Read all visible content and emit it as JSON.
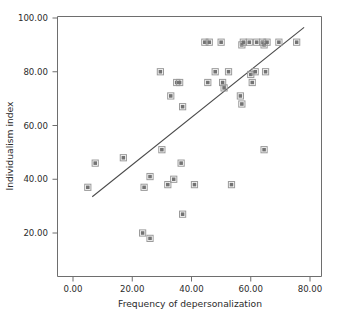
{
  "chart_data": {
    "type": "scatter",
    "title": "",
    "xlabel": "Frequency of depersonalization",
    "ylabel": "Individualism index",
    "xlim": [
      -5,
      85
    ],
    "ylim": [
      8,
      108
    ],
    "xticks": [
      "0.00",
      "20.00",
      "40.00",
      "60.00",
      "80.00"
    ],
    "xtick_values": [
      0,
      20,
      40,
      60,
      80
    ],
    "yticks": [
      "20.00",
      "40.00",
      "60.00",
      "80.00",
      "100.00"
    ],
    "ytick_values": [
      20,
      40,
      60,
      80,
      100
    ],
    "grid": false,
    "legend": "none",
    "marker": "square",
    "marker_color": "#737373",
    "marker_edge_color": "#9a9a9a",
    "line_color": "#4a4a4a",
    "axis_color": "#6e6e6e",
    "points": [
      {
        "x": 5,
        "y": 37
      },
      {
        "x": 7.5,
        "y": 46
      },
      {
        "x": 17,
        "y": 48
      },
      {
        "x": 23.5,
        "y": 20
      },
      {
        "x": 24,
        "y": 37
      },
      {
        "x": 26,
        "y": 18
      },
      {
        "x": 26,
        "y": 41
      },
      {
        "x": 29.5,
        "y": 80
      },
      {
        "x": 30,
        "y": 51
      },
      {
        "x": 32,
        "y": 38
      },
      {
        "x": 33,
        "y": 71
      },
      {
        "x": 34,
        "y": 40
      },
      {
        "x": 35,
        "y": 76
      },
      {
        "x": 36,
        "y": 76
      },
      {
        "x": 36.5,
        "y": 46
      },
      {
        "x": 37,
        "y": 27
      },
      {
        "x": 37,
        "y": 67
      },
      {
        "x": 41,
        "y": 38
      },
      {
        "x": 44.5,
        "y": 91
      },
      {
        "x": 46,
        "y": 91
      },
      {
        "x": 45.5,
        "y": 76
      },
      {
        "x": 48,
        "y": 80
      },
      {
        "x": 50,
        "y": 91
      },
      {
        "x": 50.5,
        "y": 76
      },
      {
        "x": 51,
        "y": 74
      },
      {
        "x": 52.5,
        "y": 80
      },
      {
        "x": 53.5,
        "y": 38
      },
      {
        "x": 56.5,
        "y": 71
      },
      {
        "x": 57,
        "y": 68
      },
      {
        "x": 57,
        "y": 90
      },
      {
        "x": 57.5,
        "y": 91
      },
      {
        "x": 59.5,
        "y": 91
      },
      {
        "x": 60,
        "y": 79
      },
      {
        "x": 60.5,
        "y": 76
      },
      {
        "x": 61.5,
        "y": 80
      },
      {
        "x": 62,
        "y": 91
      },
      {
        "x": 64,
        "y": 91
      },
      {
        "x": 64.5,
        "y": 51
      },
      {
        "x": 64.5,
        "y": 90
      },
      {
        "x": 65,
        "y": 80
      },
      {
        "x": 65.5,
        "y": 91
      },
      {
        "x": 69.5,
        "y": 91
      },
      {
        "x": 75.5,
        "y": 91
      }
    ],
    "fit_line": {
      "x0": 6.5,
      "y0": 33.5,
      "x1": 78,
      "y1": 96.5
    }
  }
}
